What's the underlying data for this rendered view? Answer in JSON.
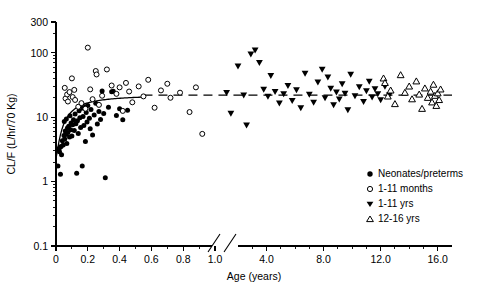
{
  "chart_data": {
    "type": "scatter",
    "title": "",
    "xlabel": "Age (years)",
    "ylabel": "CL/F (L/hr/70 Kg)",
    "yscale": "log",
    "ylim": [
      0.1,
      300
    ],
    "ytick_labels": [
      "300",
      "100",
      "10",
      "1",
      "0.1"
    ],
    "ytick_values": [
      300,
      100,
      10,
      1,
      0.1
    ],
    "xtick_labels": [
      "0",
      "0.2",
      "0.4",
      "0.6",
      "0.8",
      "1.0",
      "4.0",
      "8.0",
      "12.0",
      "16.0"
    ],
    "xtick_values": [
      0,
      0.2,
      0.4,
      0.6,
      0.8,
      1.0,
      4.0,
      8.0,
      12.0,
      16.0
    ],
    "axis_break": {
      "after": 1.0,
      "before": 4.0,
      "marker": "double-slash"
    },
    "grid": false,
    "legend_position": "lower-right",
    "annotations": [
      {
        "name": "fit-curve",
        "style": "solid",
        "description": "maturation fit curve rising from ~2.5 to ~22 over 0-0.55 years"
      },
      {
        "name": "reference-line",
        "style": "dashed",
        "description": "horizontal adult-equivalent clearance line at ~22 L/hr/70 Kg"
      }
    ],
    "series": [
      {
        "name": "Neonates/preterms",
        "marker": "filled-circle",
        "color": "#000000",
        "points": [
          [
            0.012,
            1.75
          ],
          [
            0.018,
            3.2
          ],
          [
            0.022,
            2.9
          ],
          [
            0.025,
            3.4
          ],
          [
            0.028,
            1.3
          ],
          [
            0.032,
            3.5
          ],
          [
            0.035,
            2.6
          ],
          [
            0.04,
            4.3
          ],
          [
            0.045,
            3.7
          ],
          [
            0.05,
            5.2
          ],
          [
            0.052,
            8.6
          ],
          [
            0.055,
            4.6
          ],
          [
            0.058,
            6.1
          ],
          [
            0.062,
            5.4
          ],
          [
            0.065,
            9.4
          ],
          [
            0.068,
            3.9
          ],
          [
            0.072,
            6.8
          ],
          [
            0.075,
            5.8
          ],
          [
            0.08,
            7.2
          ],
          [
            0.085,
            4.9
          ],
          [
            0.088,
            10.5
          ],
          [
            0.092,
            6.4
          ],
          [
            0.095,
            8.1
          ],
          [
            0.1,
            5.1
          ],
          [
            0.105,
            7.6
          ],
          [
            0.11,
            9.1
          ],
          [
            0.115,
            6.2
          ],
          [
            0.12,
            11.2
          ],
          [
            0.125,
            7.9
          ],
          [
            0.13,
            1.35
          ],
          [
            0.135,
            8.8
          ],
          [
            0.14,
            5.6
          ],
          [
            0.145,
            12.6
          ],
          [
            0.15,
            9.8
          ],
          [
            0.155,
            6.9
          ],
          [
            0.16,
            13.8
          ],
          [
            0.165,
            1.75
          ],
          [
            0.17,
            10.2
          ],
          [
            0.175,
            7.4
          ],
          [
            0.18,
            14.5
          ],
          [
            0.185,
            4.2
          ],
          [
            0.19,
            11.8
          ],
          [
            0.195,
            8.4
          ],
          [
            0.2,
            15.2
          ],
          [
            0.21,
            9.6
          ],
          [
            0.215,
            6.6
          ],
          [
            0.22,
            13.1
          ],
          [
            0.23,
            5.3
          ],
          [
            0.24,
            10.8
          ],
          [
            0.25,
            16.4
          ],
          [
            0.26,
            7.8
          ],
          [
            0.27,
            12.2
          ],
          [
            0.28,
            9.2
          ],
          [
            0.29,
            25.5
          ],
          [
            0.3,
            11.4
          ],
          [
            0.31,
            1.15
          ],
          [
            0.33,
            14.2
          ],
          [
            0.35,
            24.8
          ],
          [
            0.36,
            25.2
          ],
          [
            0.38,
            10.6
          ],
          [
            0.4,
            13.5
          ],
          [
            0.42,
            9.1
          ],
          [
            0.45,
            12.8
          ]
        ]
      },
      {
        "name": "1-11 months",
        "marker": "open-circle",
        "color": "#000000",
        "points": [
          [
            0.055,
            28.5
          ],
          [
            0.06,
            19.5
          ],
          [
            0.07,
            22.5
          ],
          [
            0.075,
            17.5
          ],
          [
            0.085,
            24.5
          ],
          [
            0.1,
            40.0
          ],
          [
            0.105,
            20.5
          ],
          [
            0.115,
            26.5
          ],
          [
            0.12,
            18.5
          ],
          [
            0.14,
            14.5
          ],
          [
            0.16,
            16.5
          ],
          [
            0.185,
            13.5
          ],
          [
            0.2,
            120.0
          ],
          [
            0.215,
            27.0
          ],
          [
            0.23,
            19.0
          ],
          [
            0.25,
            52.0
          ],
          [
            0.255,
            46.0
          ],
          [
            0.27,
            15.5
          ],
          [
            0.29,
            21.5
          ],
          [
            0.32,
            55.0
          ],
          [
            0.35,
            31.0
          ],
          [
            0.38,
            23.0
          ],
          [
            0.4,
            29.0
          ],
          [
            0.42,
            12.5
          ],
          [
            0.44,
            34.0
          ],
          [
            0.46,
            25.0
          ],
          [
            0.48,
            17.0
          ],
          [
            0.52,
            30.0
          ],
          [
            0.55,
            21.0
          ],
          [
            0.58,
            38.0
          ],
          [
            0.62,
            14.0
          ],
          [
            0.66,
            26.0
          ],
          [
            0.7,
            33.0
          ],
          [
            0.72,
            20.0
          ],
          [
            0.78,
            24.0
          ],
          [
            0.84,
            12.0
          ],
          [
            0.88,
            29.0
          ],
          [
            0.92,
            5.5
          ]
        ]
      },
      {
        "name": "1-11 yrs",
        "marker": "filled-triangle-down",
        "color": "#000000",
        "points": [
          [
            1.2,
            24.0
          ],
          [
            1.5,
            11.5
          ],
          [
            2.0,
            62.0
          ],
          [
            2.4,
            22.0
          ],
          [
            2.6,
            7.5
          ],
          [
            2.9,
            95.0
          ],
          [
            3.2,
            110.0
          ],
          [
            3.5,
            70.0
          ],
          [
            3.8,
            27.0
          ],
          [
            4.1,
            21.0
          ],
          [
            4.3,
            44.0
          ],
          [
            4.6,
            25.0
          ],
          [
            4.9,
            16.5
          ],
          [
            5.2,
            23.0
          ],
          [
            5.5,
            31.0
          ],
          [
            5.8,
            18.0
          ],
          [
            6.1,
            26.5
          ],
          [
            6.4,
            14.0
          ],
          [
            6.7,
            48.0
          ],
          [
            7.0,
            22.5
          ],
          [
            7.3,
            17.0
          ],
          [
            7.6,
            35.0
          ],
          [
            7.9,
            55.0
          ],
          [
            8.1,
            20.0
          ],
          [
            8.3,
            42.0
          ],
          [
            8.5,
            28.0
          ],
          [
            8.7,
            15.5
          ],
          [
            8.9,
            24.5
          ],
          [
            9.1,
            19.0
          ],
          [
            9.3,
            33.0
          ],
          [
            9.5,
            23.5
          ],
          [
            9.7,
            13.0
          ],
          [
            9.9,
            46.0
          ],
          [
            10.2,
            21.5
          ],
          [
            10.5,
            29.5
          ],
          [
            10.8,
            17.5
          ],
          [
            11.0,
            25.5
          ],
          [
            11.2,
            36.0
          ],
          [
            11.4,
            20.5
          ],
          [
            11.6,
            27.5
          ],
          [
            11.8,
            23.0
          ],
          [
            12.0,
            18.5
          ],
          [
            12.3,
            30.0
          ],
          [
            12.6,
            22.0
          ]
        ]
      },
      {
        "name": "12-16 yrs",
        "marker": "open-triangle-up",
        "color": "#000000",
        "points": [
          [
            12.2,
            40.0
          ],
          [
            12.3,
            34.0
          ],
          [
            12.5,
            21.0
          ],
          [
            12.7,
            26.0
          ],
          [
            13.0,
            16.0
          ],
          [
            13.4,
            45.0
          ],
          [
            13.7,
            24.0
          ],
          [
            14.0,
            30.0
          ],
          [
            14.2,
            19.0
          ],
          [
            14.5,
            36.0
          ],
          [
            14.7,
            22.5
          ],
          [
            14.9,
            13.5
          ],
          [
            15.1,
            28.0
          ],
          [
            15.3,
            20.0
          ],
          [
            15.5,
            25.0
          ],
          [
            15.6,
            17.0
          ],
          [
            15.7,
            32.0
          ],
          [
            15.8,
            21.5
          ],
          [
            15.9,
            15.0
          ],
          [
            16.0,
            23.5
          ],
          [
            16.1,
            18.5
          ],
          [
            16.2,
            27.0
          ]
        ]
      }
    ]
  },
  "legend": {
    "items": [
      {
        "label": "Neonates/preterms",
        "marker": "filled-circle"
      },
      {
        "label": "1-11 months",
        "marker": "open-circle"
      },
      {
        "label": "1-11 yrs",
        "marker": "filled-triangle-down"
      },
      {
        "label": "12-16 yrs",
        "marker": "open-triangle-up"
      }
    ]
  }
}
